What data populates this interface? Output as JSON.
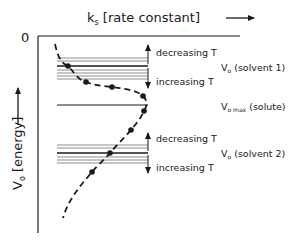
{
  "diagram": {
    "x_axis_label": "k",
    "x_axis_sub": "s",
    "x_axis_unit": " [rate constant]",
    "y_axis_label": "V",
    "y_axis_sub": "o",
    "y_axis_unit": " [energy]",
    "origin_label": "0",
    "upper_band": {
      "label_main": "V",
      "label_sub": "o",
      "label_rest": " (solvent 1)",
      "decreasing": "decreasing T",
      "increasing": "increasing T"
    },
    "middle_line": {
      "label_main": "V",
      "label_sub": "o max",
      "label_rest": " (solute)"
    },
    "lower_band": {
      "label_main": "V",
      "label_sub": "o",
      "label_rest": " (solvent 2)",
      "decreasing": "decreasing T",
      "increasing": "increasing T"
    },
    "colors": {
      "line": "#1a1a1a",
      "band_line": "#8c8c8c"
    }
  }
}
